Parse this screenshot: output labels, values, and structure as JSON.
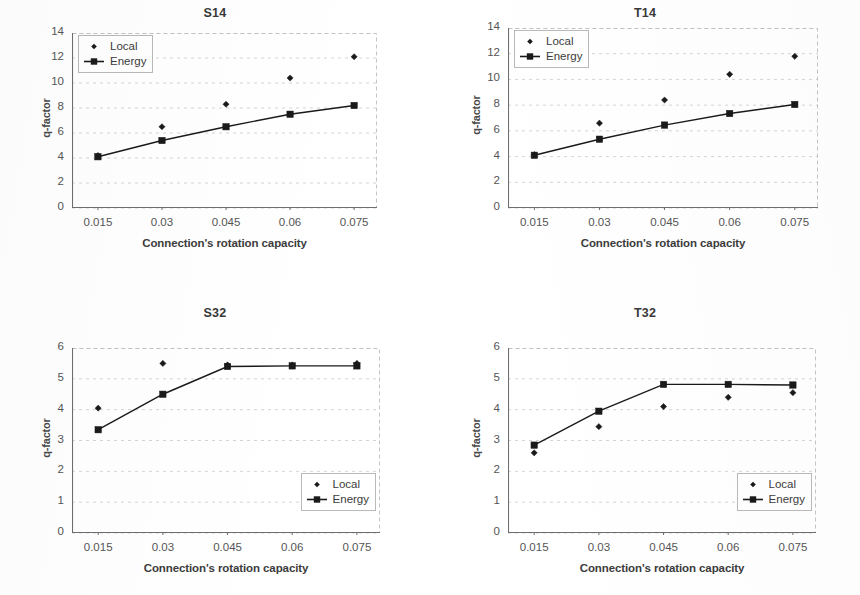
{
  "page": {
    "background": "#ffffff",
    "ink": "#3a3a3a"
  },
  "common": {
    "xlabel": "Connection's rotation capacity",
    "ylabel": "q-factor",
    "xticks": [
      "0.015",
      "0.03",
      "0.045",
      "0.06",
      "0.075"
    ],
    "legend": {
      "local": "Local",
      "energy": "Energy"
    },
    "series_color": "#1a1a1a"
  },
  "chart_data": [
    {
      "id": "S14",
      "type": "scatter",
      "title": "S14",
      "xlabel": "Connection's rotation capacity",
      "ylabel": "q-factor",
      "x": [
        0.015,
        0.03,
        0.045,
        0.06,
        0.075
      ],
      "xticklabels": [
        "0.015",
        "0.03",
        "0.045",
        "0.06",
        "0.075"
      ],
      "yticks": [
        0,
        2,
        4,
        6,
        8,
        10,
        12,
        14
      ],
      "ylim": [
        0,
        14
      ],
      "grid": true,
      "legend_position": "upper-left",
      "series": [
        {
          "name": "Local",
          "marker": "diamond",
          "line": false,
          "values": [
            4.2,
            6.5,
            8.3,
            10.4,
            12.1
          ]
        },
        {
          "name": "Energy",
          "marker": "square",
          "line": true,
          "values": [
            4.1,
            5.4,
            6.5,
            7.5,
            8.2
          ]
        }
      ]
    },
    {
      "id": "T14",
      "type": "scatter",
      "title": "T14",
      "xlabel": "Connection's rotation capacity",
      "ylabel": "q-factor",
      "x": [
        0.015,
        0.03,
        0.045,
        0.06,
        0.075
      ],
      "xticklabels": [
        "0.015",
        "0.03",
        "0.045",
        "0.06",
        "0.075"
      ],
      "yticks": [
        0,
        2,
        4,
        6,
        8,
        10,
        12,
        14
      ],
      "ylim": [
        0,
        14
      ],
      "grid": true,
      "legend_position": "upper-left",
      "series": [
        {
          "name": "Local",
          "marker": "diamond",
          "line": false,
          "values": [
            4.15,
            6.6,
            8.4,
            10.4,
            11.8
          ]
        },
        {
          "name": "Energy",
          "marker": "square",
          "line": true,
          "values": [
            4.1,
            5.35,
            6.45,
            7.35,
            8.05
          ]
        }
      ]
    },
    {
      "id": "S32",
      "type": "scatter",
      "title": "S32",
      "xlabel": "Connection's rotation capacity",
      "ylabel": "q-factor",
      "x": [
        0.015,
        0.03,
        0.045,
        0.06,
        0.075
      ],
      "xticklabels": [
        "0.015",
        "0.03",
        "0.045",
        "0.06",
        "0.075"
      ],
      "yticks": [
        0,
        1,
        2,
        3,
        4,
        5,
        6
      ],
      "ylim": [
        0,
        6
      ],
      "grid": true,
      "legend_position": "lower-right",
      "series": [
        {
          "name": "Local",
          "marker": "diamond",
          "line": false,
          "values": [
            4.05,
            5.5,
            5.45,
            5.45,
            5.5
          ]
        },
        {
          "name": "Energy",
          "marker": "square",
          "line": true,
          "values": [
            3.35,
            4.5,
            5.4,
            5.42,
            5.42
          ]
        }
      ]
    },
    {
      "id": "T32",
      "type": "scatter",
      "title": "T32",
      "xlabel": "Connection's rotation capacity",
      "ylabel": "q-factor",
      "x": [
        0.015,
        0.03,
        0.045,
        0.06,
        0.075
      ],
      "xticklabels": [
        "0.015",
        "0.03",
        "0.045",
        "0.06",
        "0.075"
      ],
      "yticks": [
        0,
        1,
        2,
        3,
        4,
        5,
        6
      ],
      "ylim": [
        0,
        6
      ],
      "grid": true,
      "legend_position": "lower-right",
      "series": [
        {
          "name": "Local",
          "marker": "diamond",
          "line": false,
          "values": [
            2.6,
            3.45,
            4.1,
            4.4,
            4.55
          ]
        },
        {
          "name": "Energy",
          "marker": "square",
          "line": true,
          "values": [
            2.85,
            3.95,
            4.82,
            4.82,
            4.8
          ]
        }
      ]
    }
  ]
}
